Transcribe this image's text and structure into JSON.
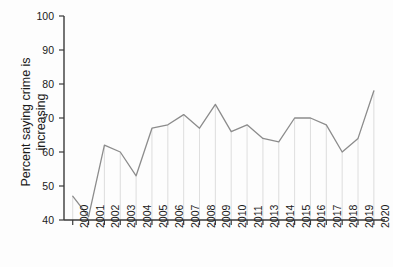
{
  "chart_data": {
    "type": "line",
    "title": "",
    "xlabel": "",
    "ylabel": "Percent saying crime is\nincreasing",
    "ylim": [
      40,
      100
    ],
    "ytick_values": [
      40,
      50,
      60,
      70,
      80,
      90,
      100
    ],
    "ytick_labels": [
      "40",
      "50",
      "60",
      "70",
      "80",
      "90",
      "100"
    ],
    "grid": false,
    "legend": "none",
    "line_color": "#8c8c8c",
    "axis_color": "#3a3a3a",
    "dropline_color": "#d6d6d6",
    "categories": [
      "2000",
      "2001",
      "2002",
      "2003",
      "2004",
      "2005",
      "2006",
      "2007",
      "2008",
      "2009",
      "2010",
      "2011",
      "2013",
      "2014",
      "2015",
      "2016",
      "2017",
      "2018",
      "2019",
      "2020"
    ],
    "values": [
      47,
      41,
      62,
      60,
      53,
      67,
      68,
      71,
      67,
      74,
      66,
      68,
      64,
      63,
      70,
      70,
      68,
      60,
      64,
      78
    ],
    "dropline_categories": [
      "2000",
      "2001",
      "2002",
      "2003",
      "2004",
      "2005",
      "2006",
      "2007",
      "2008",
      "2009",
      "2010",
      "2011",
      "2013",
      "2014",
      "2015",
      "2016",
      "2017",
      "2018",
      "2019",
      "2020"
    ]
  }
}
